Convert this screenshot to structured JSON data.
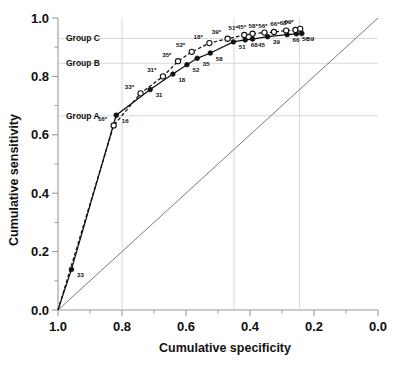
{
  "chart_data": {
    "type": "line",
    "title": "",
    "xlabel": "Cumulative specificity",
    "ylabel": "Cumulative sensitivity",
    "xlim": [
      1.0,
      0.0
    ],
    "ylim": [
      0.0,
      1.0
    ],
    "x_reversed": true,
    "xticks": [
      "1.0",
      "0.8",
      "0.6",
      "0.4",
      "0.2",
      "0.0"
    ],
    "xtick_values": [
      1.0,
      0.8,
      0.6,
      0.4,
      0.2,
      0.0
    ],
    "yticks": [
      "0.0",
      "0.2",
      "0.4",
      "0.6",
      "0.8",
      "1.0"
    ],
    "ytick_values": [
      0.0,
      0.2,
      0.4,
      0.6,
      0.8,
      1.0
    ],
    "grid": true,
    "gridlines_vertical": [
      0.8,
      0.45,
      0.245
    ],
    "gridlines_horizontal": [
      0.665,
      0.845,
      0.93
    ],
    "legend": "none",
    "annotations": [
      {
        "name": "Group A",
        "y": 0.665
      },
      {
        "name": "Group B",
        "y": 0.845
      },
      {
        "name": "Group C",
        "y": 0.93
      }
    ],
    "reference_line": {
      "name": "chance-diagonal",
      "from": [
        1.0,
        0.0
      ],
      "to": [
        0.0,
        1.0
      ]
    },
    "series": [
      {
        "name": "solid-curve",
        "marker": "filled-circle",
        "linestyle": "solid",
        "points": [
          {
            "x": 1.0,
            "y": 0.0,
            "label": ""
          },
          {
            "x": 0.958,
            "y": 0.139,
            "label": "33"
          },
          {
            "x": 0.818,
            "y": 0.667,
            "label": "16"
          },
          {
            "x": 0.712,
            "y": 0.755,
            "label": "31"
          },
          {
            "x": 0.641,
            "y": 0.808,
            "label": "18"
          },
          {
            "x": 0.597,
            "y": 0.84,
            "label": "52"
          },
          {
            "x": 0.565,
            "y": 0.862,
            "label": "35"
          },
          {
            "x": 0.524,
            "y": 0.88,
            "label": "58"
          },
          {
            "x": 0.452,
            "y": 0.918,
            "label": "51"
          },
          {
            "x": 0.415,
            "y": 0.925,
            "label": "68"
          },
          {
            "x": 0.392,
            "y": 0.928,
            "label": "45"
          },
          {
            "x": 0.345,
            "y": 0.936,
            "label": "39"
          },
          {
            "x": 0.284,
            "y": 0.943,
            "label": "66"
          },
          {
            "x": 0.255,
            "y": 0.946,
            "label": "56"
          },
          {
            "x": 0.238,
            "y": 0.947,
            "label": "59"
          }
        ]
      },
      {
        "name": "dashed-curve",
        "marker": "open-circle",
        "linestyle": "dashed",
        "points": [
          {
            "x": 1.0,
            "y": 0.0,
            "label": ""
          },
          {
            "x": 0.826,
            "y": 0.632,
            "label": "16*"
          },
          {
            "x": 0.742,
            "y": 0.742,
            "label": "33*"
          },
          {
            "x": 0.672,
            "y": 0.8,
            "label": "31*"
          },
          {
            "x": 0.625,
            "y": 0.852,
            "label": "35*"
          },
          {
            "x": 0.582,
            "y": 0.884,
            "label": "52*"
          },
          {
            "x": 0.527,
            "y": 0.914,
            "label": "18*"
          },
          {
            "x": 0.47,
            "y": 0.929,
            "label": "39*"
          },
          {
            "x": 0.418,
            "y": 0.942,
            "label": "51*"
          },
          {
            "x": 0.392,
            "y": 0.946,
            "label": "45*"
          },
          {
            "x": 0.355,
            "y": 0.95,
            "label": "58*"
          },
          {
            "x": 0.325,
            "y": 0.952,
            "label": "56*"
          },
          {
            "x": 0.287,
            "y": 0.957,
            "label": "66*"
          },
          {
            "x": 0.258,
            "y": 0.959,
            "label": "68*"
          },
          {
            "x": 0.243,
            "y": 0.963,
            "label": "59*"
          }
        ]
      }
    ]
  },
  "colors": {
    "curve": "#111111",
    "reference": "#7a7a7a",
    "grid": "#d8d8d8",
    "axis": "#9a9a9a",
    "text": "#111111",
    "background": "#ffffff"
  }
}
